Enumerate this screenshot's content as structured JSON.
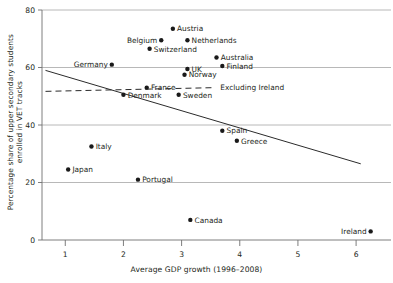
{
  "chart_data": {
    "type": "scatter",
    "title": "",
    "xlabel": "Average GDP growth (1996–2008)",
    "ylabel_line1": "Percentage share of upper secondary students",
    "ylabel_line2": "enrolled in VET tracks",
    "xlim": [
      0.6,
      6.6
    ],
    "ylim": [
      0,
      80
    ],
    "xticks": [
      1,
      2,
      3,
      4,
      5,
      6
    ],
    "xtick_labels": [
      "1",
      "2",
      "3",
      "4",
      "5",
      "6"
    ],
    "yticks": [
      0,
      20,
      40,
      60,
      80
    ],
    "ytick_labels": [
      "0",
      "20",
      "40",
      "60",
      "80"
    ],
    "grid": "horizontal",
    "legend_position": "inline-annotation",
    "points": [
      {
        "label": "Austria",
        "x": 2.85,
        "y": 73.5,
        "label_side": "right"
      },
      {
        "label": "Belgium",
        "x": 2.65,
        "y": 69.5,
        "label_side": "left"
      },
      {
        "label": "Netherlands",
        "x": 3.1,
        "y": 69.5,
        "label_side": "right"
      },
      {
        "label": "Switzerland",
        "x": 2.45,
        "y": 66.5,
        "label_side": "right"
      },
      {
        "label": "Germany",
        "x": 1.8,
        "y": 61.0,
        "label_side": "left"
      },
      {
        "label": "Australia",
        "x": 3.6,
        "y": 63.5,
        "label_side": "right"
      },
      {
        "label": "Finland",
        "x": 3.7,
        "y": 60.5,
        "label_side": "right"
      },
      {
        "label": "UK",
        "x": 3.1,
        "y": 59.5,
        "label_side": "right"
      },
      {
        "label": "Norway",
        "x": 3.05,
        "y": 57.5,
        "label_side": "right"
      },
      {
        "label": "France",
        "x": 2.4,
        "y": 53.0,
        "label_side": "right"
      },
      {
        "label": "Denmark",
        "x": 2.0,
        "y": 50.5,
        "label_side": "right"
      },
      {
        "label": "Sweden",
        "x": 2.95,
        "y": 50.5,
        "label_side": "right"
      },
      {
        "label": "Spain",
        "x": 3.7,
        "y": 38.0,
        "label_side": "right"
      },
      {
        "label": "Greece",
        "x": 3.95,
        "y": 34.5,
        "label_side": "right"
      },
      {
        "label": "Italy",
        "x": 1.45,
        "y": 32.5,
        "label_side": "right"
      },
      {
        "label": "Japan",
        "x": 1.05,
        "y": 24.5,
        "label_side": "right"
      },
      {
        "label": "Portugal",
        "x": 2.25,
        "y": 21.0,
        "label_side": "right"
      },
      {
        "label": "Canada",
        "x": 3.15,
        "y": 7.0,
        "label_side": "right"
      },
      {
        "label": "Ireland",
        "x": 6.25,
        "y": 3.0,
        "label_side": "left"
      }
    ],
    "trendlines": [
      {
        "name": "All countries",
        "style": "solid",
        "x_start": 0.66,
        "y_start": 59.0,
        "x_end": 6.08,
        "y_end": 26.5,
        "annotation": ""
      },
      {
        "name": "Excluding Ireland",
        "style": "dashed",
        "x_start": 0.66,
        "y_start": 51.7,
        "x_end": 3.58,
        "y_end": 53.0,
        "annotation": "Excluding Ireland"
      }
    ],
    "colors": {
      "point": "#1a1a1a",
      "line": "#2b2b2b",
      "grid": "#a6a6a6",
      "axis": "#6f6f6f",
      "text": "#231f20",
      "background": "#ffffff"
    }
  }
}
